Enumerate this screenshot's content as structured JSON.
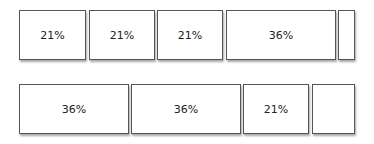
{
  "rows": [
    {
      "boxes": [
        {
          "label": "21%",
          "x": 19,
          "w": 67
        },
        {
          "label": "21%",
          "x": 89,
          "w": 66
        },
        {
          "label": "21%",
          "x": 157,
          "w": 66
        },
        {
          "label": "36%",
          "x": 226,
          "w": 110
        },
        {
          "label": "",
          "x": 338,
          "w": 17
        }
      ],
      "y": 10,
      "h": 50
    },
    {
      "boxes": [
        {
          "label": "36%",
          "x": 19,
          "w": 110
        },
        {
          "label": "36%",
          "x": 131,
          "w": 110
        },
        {
          "label": "21%",
          "x": 243,
          "w": 66
        },
        {
          "label": "",
          "x": 312,
          "w": 43
        }
      ],
      "y": 84,
      "h": 50
    }
  ]
}
